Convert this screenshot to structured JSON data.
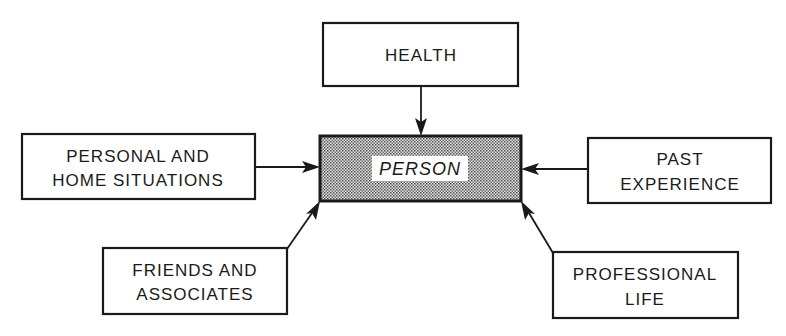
{
  "diagram": {
    "center": {
      "label": "PERSON"
    },
    "nodes": [
      {
        "id": "health",
        "lines": [
          "HEALTH"
        ]
      },
      {
        "id": "personal-home",
        "lines": [
          "PERSONAL AND",
          "HOME SITUATIONS"
        ]
      },
      {
        "id": "past-experience",
        "lines": [
          "PAST",
          "EXPERIENCE"
        ]
      },
      {
        "id": "friends",
        "lines": [
          "FRIENDS AND",
          "ASSOCIATES"
        ]
      },
      {
        "id": "professional",
        "lines": [
          "PROFESSIONAL",
          "LIFE"
        ]
      }
    ],
    "edges": [
      {
        "from": "health",
        "to": "center"
      },
      {
        "from": "personal-home",
        "to": "center"
      },
      {
        "from": "past-experience",
        "to": "center"
      },
      {
        "from": "friends",
        "to": "center"
      },
      {
        "from": "professional",
        "to": "center"
      }
    ],
    "colors": {
      "ink": "#1a1a1a",
      "background": "#ffffff"
    }
  }
}
